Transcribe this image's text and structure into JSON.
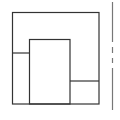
{
  "diagram": {
    "type": "floor-plan-outline",
    "stroke_color": "#333333",
    "divider_color": "#777777",
    "background": "#ffffff",
    "shapes": {
      "outer_rect": {
        "x": 12,
        "y": 12,
        "w": 87,
        "h": 92
      },
      "inner_rect": {
        "x": 29.5,
        "y": 39.5,
        "w": 40.5,
        "h": 64.5
      },
      "left_divider": {
        "x1": 12,
        "y1": 53,
        "x2": 29.5,
        "y2": 53
      },
      "right_divider": {
        "x1": 70,
        "y1": 81,
        "x2": 99,
        "y2": 81
      },
      "side_line": {
        "x": 112,
        "y_top": 2,
        "y_bottom": 110,
        "dash_segments": [
          [
            2,
            42
          ],
          [
            47,
            53
          ],
          [
            58,
            63
          ],
          [
            68,
            110
          ]
        ]
      }
    }
  }
}
